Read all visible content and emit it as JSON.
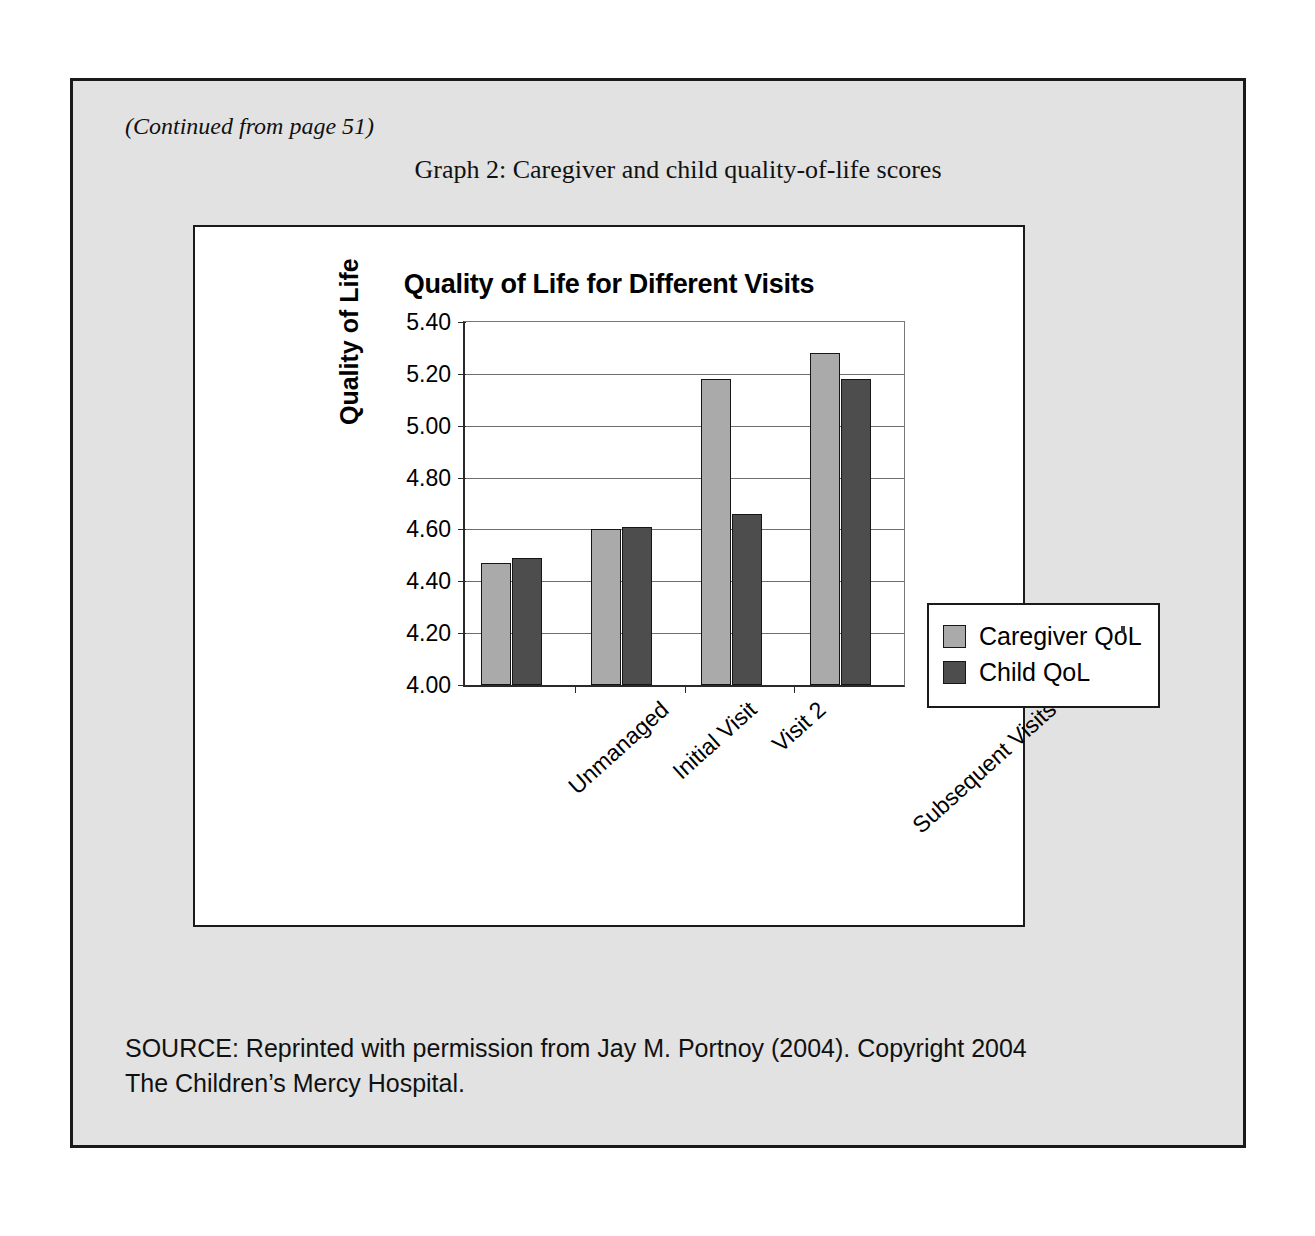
{
  "page": {
    "continued_note": "(Continued from page 51)",
    "figure_caption": "Graph 2:  Caregiver and child quality-of-life scores",
    "source_line_1": "SOURCE: Reprinted with permission from Jay M. Portnoy (2004).  Copyright 2004",
    "source_line_2": "The Children’s Mercy Hospital."
  },
  "chart_data": {
    "type": "bar",
    "title": "Quality of Life for Different Visits",
    "xlabel": "",
    "ylabel": "Quality of Life",
    "ylim": [
      4.0,
      5.4
    ],
    "ytick_step": 0.2,
    "ytick_labels": [
      "5.40",
      "5.20",
      "5.00",
      "4.80",
      "4.60",
      "4.40",
      "4.20",
      "4.00"
    ],
    "ytick_values": [
      5.4,
      5.2,
      5.0,
      4.8,
      4.6,
      4.4,
      4.2,
      4.0
    ],
    "grid": true,
    "legend_position": "right",
    "categories": [
      "Unmanaged",
      "Initial Visit",
      "Visit 2",
      "Subsequent Visits"
    ],
    "series": [
      {
        "name": "Caregiver QoL",
        "color": "#aaaaaa",
        "values": [
          4.47,
          4.6,
          5.18,
          5.28
        ]
      },
      {
        "name": "Child QoL",
        "color": "#4d4d4d",
        "values": [
          4.49,
          4.61,
          4.66,
          5.18
        ]
      }
    ]
  },
  "colors": {
    "page_background": "#e2e2e2",
    "panel_background": "#ffffff",
    "frame": "#1a1a1a",
    "caregiver_bar": "#aaaaaa",
    "child_bar": "#4d4d4d",
    "gridline": "#6e6e6e"
  }
}
